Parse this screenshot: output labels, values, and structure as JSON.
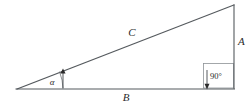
{
  "diagram": {
    "type": "right-triangle-geometry",
    "title": "",
    "background_color": "#ffffff",
    "line_color": "#555a5e",
    "text_color": "#2b2b2b",
    "labels": {
      "hypotenuse": "C",
      "vertical_side": "A",
      "horizontal_side": "B",
      "acute_angle": "α",
      "right_angle": "90°"
    },
    "vertices": {
      "left": {
        "x": 17,
        "y": 89
      },
      "bottom_right": {
        "x": 234,
        "y": 88
      },
      "top_right": {
        "x": 234,
        "y": 5
      }
    },
    "label_positions": {
      "hypotenuse": {
        "x": 132,
        "y": 36
      },
      "vertical_side": {
        "x": 238,
        "y": 44
      },
      "horizontal_side": {
        "x": 126,
        "y": 100
      },
      "acute_angle": {
        "x": 52,
        "y": 85
      },
      "right_angle": {
        "x": 212,
        "y": 78
      }
    },
    "annotations": {
      "right_angle_box": {
        "x": 203,
        "y": 63,
        "width": 30,
        "height": 25
      },
      "acute_angle_arc_radius": 46,
      "acute_leader_x": 63,
      "right_leader_x": 207
    }
  }
}
